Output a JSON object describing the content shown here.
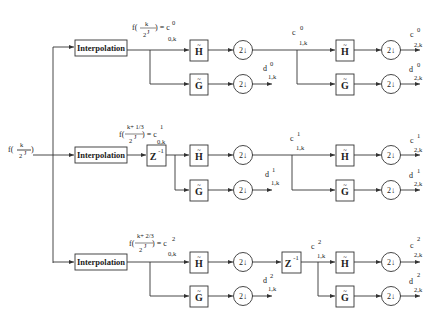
{
  "diagram": {
    "type": "wavelet-filter-bank",
    "input_label": {
      "prefix": "f(",
      "num": "k",
      "den": "2",
      "den_sup": "J",
      "suffix": ")"
    },
    "block_labels": {
      "interpolation": "Interpolation",
      "delay": "Z",
      "delay_exp": "-1",
      "h_filter": "H",
      "g_filter": "G",
      "tilde": "~",
      "downsample": "2↓"
    },
    "rows": [
      {
        "id": "row0",
        "sample_label": {
          "prefix": "f(",
          "num": "k",
          "den": "2",
          "den_sup": "J",
          "suffix": ") = c",
          "sup": "0",
          "sub": "0,k"
        },
        "c1": {
          "base": "c",
          "sup": "0",
          "sub": "1,k"
        },
        "d1": {
          "base": "d",
          "sup": "0",
          "sub": "1,k"
        },
        "c2": {
          "base": "c",
          "sup": "0",
          "sub": "2,k"
        },
        "d2": {
          "base": "d",
          "sup": "0",
          "sub": "2,k"
        }
      },
      {
        "id": "row1",
        "sample_label": {
          "prefix": "f(",
          "num": "k+ 1/3",
          "den": "2",
          "den_sup": "J",
          "suffix": ") = c",
          "sup": "1",
          "sub": "0,k"
        },
        "c1": {
          "base": "c",
          "sup": "1",
          "sub": "1,k"
        },
        "d1": {
          "base": "d",
          "sup": "1",
          "sub": "1,k"
        },
        "c2": {
          "base": "c",
          "sup": "1",
          "sub": "2,k"
        },
        "d2": {
          "base": "d",
          "sup": "1",
          "sub": "2,k"
        }
      },
      {
        "id": "row2",
        "sample_label": {
          "prefix": "f(",
          "num": "k+ 2/3",
          "den": "2",
          "den_sup": "J",
          "suffix": ") = c",
          "sup": "2",
          "sub": "0,k"
        },
        "c1": {
          "base": "c",
          "sup": "2",
          "sub": "1,k"
        },
        "d1": {
          "base": "d",
          "sup": "2",
          "sub": "1,k"
        },
        "c2": {
          "base": "c",
          "sup": "2",
          "sub": "2,k"
        },
        "d2": {
          "base": "d",
          "sup": "2",
          "sub": "2,k"
        }
      }
    ]
  }
}
